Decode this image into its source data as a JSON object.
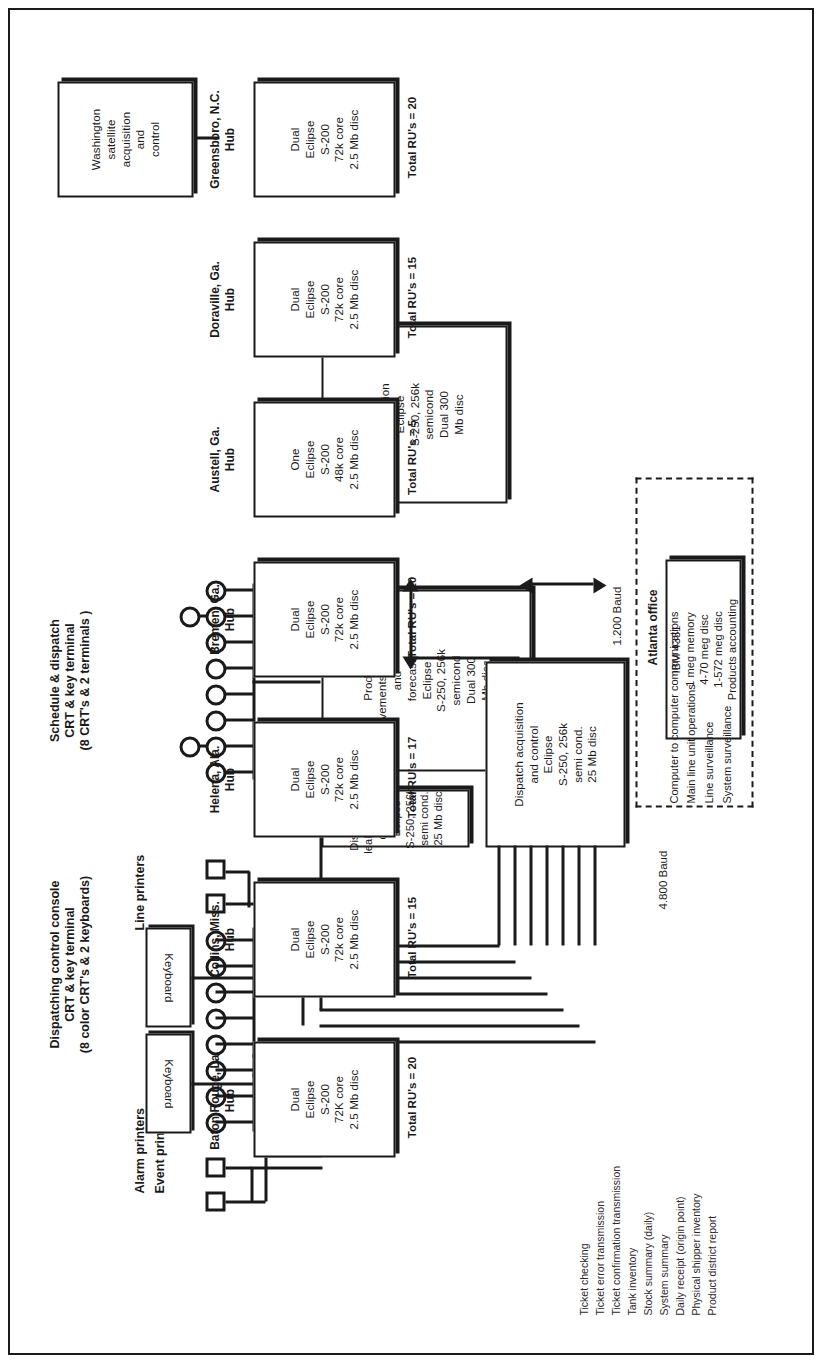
{
  "diagram": {
    "orientation": "landscape-rotated-90"
  },
  "sections": {
    "product_movements_system": "Product\nmovements\nsystem",
    "schedule_dispatch": "Schedule & dispatch\nCRT & key terminal\n(8 CRT's & 2 terminals )",
    "line_printers": "Line printers",
    "dispatching_console": "Dispatching control console\nCRT & key terminal\n(8 color CRT's & 2 keyboards)",
    "alarm_printers": "Alarm printers",
    "event_printers": "Event printers",
    "keyboard_label": "Keyboard"
  },
  "boxes": {
    "product_movements": {
      "name": "Product movements schedule and forecast",
      "lines": [
        "Product",
        "movements   schedule",
        "and",
        "forecast",
        "Eclipse",
        "S-250, 256k",
        "semicond",
        "Dual 300",
        "Mb disc"
      ]
    },
    "power_optimization": {
      "name": "Power optimization",
      "lines": [
        "Power",
        "optimization",
        "Eclipse",
        "S-250, 256k",
        "semicond",
        "Dual 300",
        "Mb disc"
      ]
    },
    "dispatch_line_backup": {
      "name": "Dispatch line leak & backup dispatch",
      "lines": [
        "Dispatch line",
        "leak & backup",
        "dispatch",
        "Eclipse",
        "S-250, 256k",
        "semi cond.",
        "25 Mb disc"
      ]
    },
    "dispatch_acquisition": {
      "name": "Dispatch acquisition and control",
      "lines": [
        "Dispatch acquisition",
        "and   control",
        "Eclipse",
        "S-250, 256k",
        "semi cond.",
        "25 Mb disc"
      ]
    },
    "atlanta_office": {
      "title": "Atlanta office",
      "lines": [
        "IBM 4331",
        "1 meg memory",
        "4-70 meg disc",
        "1-572 meg disc",
        "Products  accounting"
      ]
    },
    "washington": {
      "name": "Washington satellite acquisition and control",
      "lines": [
        "Washington",
        "satellite",
        "acquisition",
        "and",
        "control"
      ]
    }
  },
  "hubs": [
    {
      "label": "Baton Rouge, La.\nHub",
      "lines": [
        "Dual",
        "Eclipse",
        "S-200",
        "72K core",
        "2.5 Mb disc"
      ],
      "ru": "Total  RU's  =  20"
    },
    {
      "label": "Collins, Miss.\nHub",
      "lines": [
        "Dual",
        "Eclipse",
        "S-200",
        "72k core",
        "2.5 Mb disc"
      ],
      "ru": "Total  RU's  =  15"
    },
    {
      "label": "Helena, Ala.\nHub",
      "lines": [
        "Dual",
        "Eclipse",
        "S-200",
        "72k core",
        "2.5 Mb disc"
      ],
      "ru": "Total  RU's  =  17"
    },
    {
      "label": "Bremen, Ga.\nHub",
      "lines": [
        "Dual",
        "Eclipse",
        "S-200",
        "72k core",
        "2.5 Mb disc"
      ],
      "ru": "Total  RU's  =  20"
    },
    {
      "label": "Austell, Ga.\nHub",
      "lines": [
        "One",
        "Eclipse",
        "S-200",
        "48k core",
        "2.5 Mb disc"
      ],
      "ru": "Total  RU's  =  5"
    },
    {
      "label": "Doraville, Ga.\nHub",
      "lines": [
        "Dual",
        "Eclipse",
        "S-200",
        "72k core",
        "2.5 Mb disc"
      ],
      "ru": "Total  RU's  =  15"
    },
    {
      "label": "Greensboro, N.C.\nHub",
      "lines": [
        "Dual",
        "Eclipse",
        "S-200",
        "72k core",
        "2.5 Mb disc"
      ],
      "ru": "Total  RU's  =  20"
    }
  ],
  "baud_labels": {
    "low": "1.200 Baud",
    "high": "4.800 Baud"
  },
  "atlanta_functions": [
    "Computer to computer communications",
    "Main line unit operations",
    "Line surveillance",
    "System surveillance"
  ],
  "legend_items": [
    "Ticket checking",
    "Ticket error transmission",
    "Ticket confirmation transmission",
    "Tank inventory",
    "Stock summary (daily)",
    "System summary",
    "Daily receipt (origin point)",
    "Physical shipper inventory",
    "Product district report"
  ],
  "colors": {
    "ink": "#1a1a1a",
    "paper": "#ffffff"
  }
}
